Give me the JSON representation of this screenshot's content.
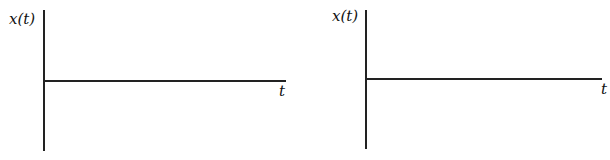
{
  "plots": [
    {
      "ylabel": "x(t)",
      "xlabel": "t"
    },
    {
      "ylabel": "x(t)",
      "xlabel": "t"
    }
  ]
}
